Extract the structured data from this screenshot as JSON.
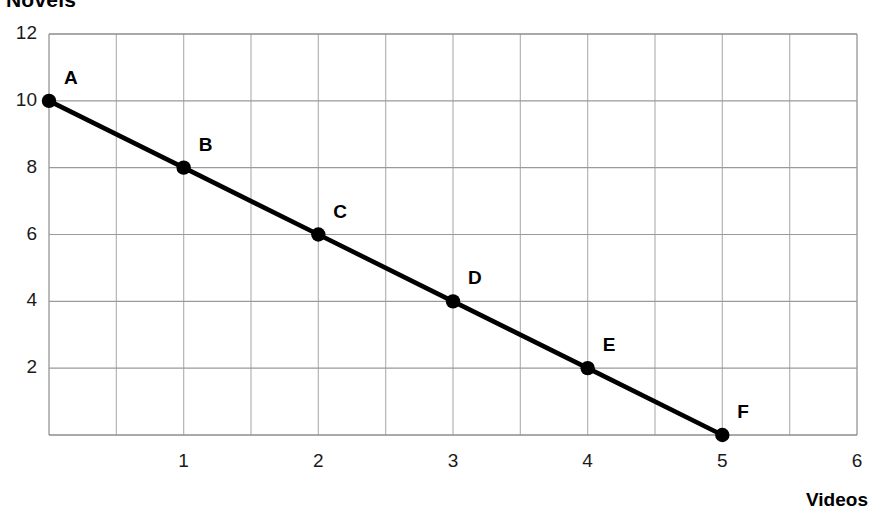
{
  "chart_data": {
    "type": "line",
    "title": "",
    "xlabel": "Videos",
    "ylabel": "Novels",
    "xlim": [
      0,
      6
    ],
    "ylim": [
      0,
      12
    ],
    "grid": true,
    "legend": "none",
    "x_ticks": [
      "1",
      "2",
      "3",
      "4",
      "5",
      "6"
    ],
    "x_tick_values": [
      1,
      2,
      3,
      4,
      5,
      6
    ],
    "y_ticks": [
      "2",
      "4",
      "6",
      "8",
      "10",
      "12"
    ],
    "y_tick_values": [
      2,
      4,
      6,
      8,
      10,
      12
    ],
    "x_minor_step": 0.5,
    "y_major_step": 2,
    "series": [
      {
        "name": "Novels vs Videos",
        "color": "#000000",
        "x": [
          0,
          1,
          2,
          3,
          4,
          5
        ],
        "y": [
          10,
          8,
          6,
          4,
          2,
          0
        ],
        "point_labels": [
          "A",
          "B",
          "C",
          "D",
          "E",
          "F"
        ]
      }
    ],
    "points": [
      {
        "label": "A",
        "x": 0,
        "y": 10
      },
      {
        "label": "B",
        "x": 1,
        "y": 8
      },
      {
        "label": "C",
        "x": 2,
        "y": 6
      },
      {
        "label": "D",
        "x": 3,
        "y": 4
      },
      {
        "label": "E",
        "x": 4,
        "y": 2
      },
      {
        "label": "F",
        "x": 5,
        "y": 0
      }
    ],
    "annotations": []
  },
  "axes": {
    "y_title": "Novels",
    "x_title": "Videos"
  },
  "colors": {
    "line": "#000000",
    "marker": "#000000",
    "grid_major": "#9a9a9a",
    "grid_minor": "#b4b4b4",
    "axis": "#8c8c8c",
    "text": "#000000",
    "background": "#ffffff"
  }
}
